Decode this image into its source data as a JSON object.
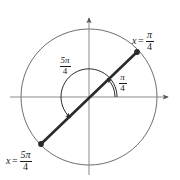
{
  "figure": {
    "background_color": "#ffffff",
    "axis_color": "#8a8a8a",
    "circle_color": "#6e6e6e",
    "line_color": "#2b2b2b",
    "text_color": "#1a1a1a"
  },
  "geometry": {
    "center_x": 89,
    "center_y": 97,
    "radius": 68,
    "x_axis_start": 10,
    "x_axis_end": 172,
    "y_axis_top": 14,
    "y_axis_bottom": 175,
    "terminal_angle_deg": 45,
    "opposite_angle_deg": 225
  },
  "labels": {
    "point_pi4": {
      "variable": "x",
      "equals": "=",
      "numerator": "π",
      "denominator": "4"
    },
    "point_5pi4": {
      "variable": "x",
      "equals": "=",
      "numerator": "5π",
      "denominator": "4"
    },
    "angle_pi4": {
      "numerator": "π",
      "denominator": "4"
    },
    "angle_5pi4": {
      "numerator": "5π",
      "denominator": "4"
    }
  },
  "points": [
    {
      "name": "point-pi-over-4",
      "x": 137,
      "y": 52,
      "angle_deg": 45
    },
    {
      "name": "point-5pi-over-4",
      "x": 41,
      "y": 144,
      "angle_deg": 225
    }
  ],
  "arcs": [
    {
      "name": "arc-pi-over-4",
      "radius": 26,
      "start_deg": 0,
      "end_deg": 45,
      "direction": "counterclockwise",
      "arrow_at": "end"
    },
    {
      "name": "arc-5pi-over-4",
      "radius": 28,
      "start_deg": 0,
      "end_deg": 225,
      "direction": "counterclockwise",
      "arrow_at": "end"
    }
  ]
}
